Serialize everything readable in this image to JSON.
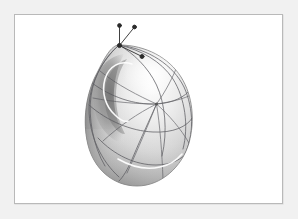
{
  "figure": {
    "domain": "scientific-illustration",
    "caption": "",
    "title": "",
    "background_color": "#f1f1f1",
    "panel_color": "#ffffff",
    "frame_color": "#b9b9b9",
    "frame": {
      "x": 14,
      "y": 14,
      "width": 269,
      "height": 190
    },
    "alt_text": "Shaded three-dimensional ovoid surface with a network of geodesic curves, a light-colored cut locus curve, a focal point where geodesics converge, and three tangent vectors at the north pole."
  },
  "surface": {
    "name": "ovoid-surface",
    "shape": "egg",
    "bounds": {
      "x": 85,
      "y": 44,
      "width": 107,
      "height": 141
    },
    "shading": {
      "highlight_color": "#fbfbfb",
      "midtone_color": "#d2d2d2",
      "shadow_color": "#8d8d8d",
      "terminator_color": "#6f6f6f",
      "rim_color": "#aeaeae"
    },
    "outline_color": "#707070"
  },
  "geodesics": {
    "name": "geodesic-network",
    "stroke_color": "#59595e",
    "stroke_width": 0.8,
    "count": 9,
    "focal_point": {
      "x": 155.5,
      "y": 103.0,
      "label": ""
    },
    "paths": [
      "M118,44 C104,56 93,74 90,95 C87,116 92,145 104,165",
      "M118,44 C100,60 88,84 88,108 C88,134 100,160 118,176",
      "M118,44 C132,52 147,66 155.5,84 C164,102 167,130 161,155",
      "M118,44 C140,49 160,60 172,78 C184,97 188,125 182,148",
      "M118,44 C148,48 172,64 183,86 C193,108 193,134 184,153",
      "M88,104 C106,120 130,130 152,131 C172,132 186,126 192,116",
      "M91,82 C110,96 133,104 155.5,103 C172,102 184,96 190,88",
      "M97,135 C113,152 134,163 155,163 C171,163 181,158 187,150",
      "M155.5,103 C149,118 140,137 132,156 C126,170 122,176 118,180"
    ],
    "radial_fan": [
      "M155.5,103 L96,72",
      "M155.5,103 L92,98",
      "M155.5,103 L101,139",
      "M155.5,103 L124,173",
      "M155.5,103 L162,180",
      "M155.5,103 L188,140",
      "M155.5,103 L191,93",
      "M155.5,103 L175,62"
    ]
  },
  "cut_locus": {
    "name": "cut-locus-curve",
    "stroke_color": "#fdfdfd",
    "stroke_width": 1.6,
    "description": "light curve forming a loop near the north pole and a trailing arc near the lower right",
    "paths": [
      "M129,62 C118,60 108,66 105,78 C102,91 107,104 116,112 C121,117 125,119 127,119",
      "M118,157 C132,164 145,167 158,165 C168,163 175,159 180,154"
    ]
  },
  "shadow_region": {
    "name": "concave-shadow-region",
    "fill_color": "#7d7d7d",
    "opacity": 0.55
  },
  "vectors": {
    "name": "tangent-vector-triad",
    "stroke_color": "#2b2b2b",
    "stroke_width": 0.9,
    "base_point": {
      "x": 118.5,
      "y": 44.5,
      "name": "north-pole-base-point"
    },
    "items": [
      {
        "name": "vector-vertical",
        "label": "",
        "from": [
          118.5,
          44.5
        ],
        "to": [
          118.5,
          24.5
        ],
        "tip_radius": 1.9
      },
      {
        "name": "vector-upper-right",
        "label": "",
        "from": [
          118.5,
          44.5
        ],
        "to": [
          133.5,
          26.0
        ],
        "tip_radius": 1.9
      },
      {
        "name": "vector-lower-right",
        "label": "",
        "from": [
          118.5,
          44.5
        ],
        "to": [
          141.0,
          55.5
        ],
        "tip_radius": 2.0
      }
    ]
  },
  "chart_data": {
    "type": "scatter",
    "title": "",
    "xlabel": "",
    "ylabel": "",
    "annotations": [
      "north pole base point",
      "three tangent vectors",
      "focal / conjugate point",
      "cut locus (light curve)"
    ],
    "series": [
      {
        "name": "vector-endpoints",
        "x": [
          118.5,
          133.5,
          141.0
        ],
        "y": [
          24.5,
          26.0,
          55.5
        ]
      },
      {
        "name": "special-points",
        "x": [
          118.5,
          155.5
        ],
        "y": [
          44.5,
          103.0
        ]
      }
    ]
  }
}
